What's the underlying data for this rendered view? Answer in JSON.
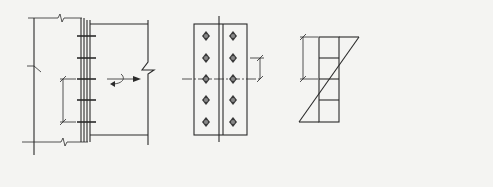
{
  "figure": {
    "panels": [
      {
        "id": "a",
        "caption": "(a)",
        "description": "Side elevation of end-plate bolted connection between column and beam",
        "labels": {
          "moment": "M",
          "axial": "N",
          "spacing": "e"
        },
        "bolt_rows": 5
      },
      {
        "id": "a-plan",
        "description": "End plate plan with two columns of bolts about axis y-y",
        "labels": {
          "axis_top": "y",
          "axis_bottom": "y",
          "distance": "y1"
        },
        "bolt_columns": 2,
        "bolt_rows": 5
      },
      {
        "id": "b",
        "caption": "(b)",
        "description": "Bolt force distribution: linear about centroid O, and uniform",
        "labels": {
          "origin": "O",
          "distance": "y1"
        }
      },
      {
        "id": "c",
        "caption": "(c)",
        "description": "Bolt force distribution: triangular about bottom bolt row O'",
        "labels": {
          "origin": "O'",
          "distance_top": "y1'",
          "distance_bottom": "y1'"
        }
      }
    ]
  }
}
